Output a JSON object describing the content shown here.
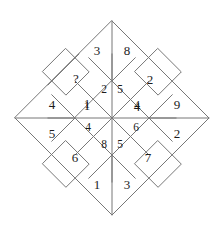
{
  "figure": {
    "type": "geometric-number-puzzle",
    "shape": "rotated-square-diamond",
    "line_color": "#777777",
    "text_color": "#1c1c1c",
    "background_color": "#ffffff",
    "unknown_marker": "?"
  },
  "geometry": {
    "center_x": 112,
    "center_y": 118,
    "outer_radius": 97,
    "middle_radius": 64,
    "inner_radius": 37,
    "top_apex_y": 15,
    "bottom_apex_y": 220,
    "left_vertex_x": 15,
    "right_vertex_x": 208
  },
  "cells": [
    {
      "id": "outer-top-left",
      "value": "3",
      "x": 97,
      "y": 50,
      "ring": "outer",
      "size": "normal"
    },
    {
      "id": "outer-top-right",
      "value": "8",
      "x": 127,
      "y": 50,
      "ring": "outer",
      "size": "normal"
    },
    {
      "id": "middle-upper-left",
      "value": "?",
      "x": 76,
      "y": 78,
      "ring": "middle",
      "size": "normal"
    },
    {
      "id": "middle-upper-right",
      "value": "2",
      "x": 150,
      "y": 79,
      "ring": "middle",
      "size": "normal"
    },
    {
      "id": "outer-left-upper",
      "value": "4",
      "x": 52,
      "y": 104,
      "ring": "outer",
      "size": "normal"
    },
    {
      "id": "outer-right-upper",
      "value": "9",
      "x": 177,
      "y": 104,
      "ring": "outer",
      "size": "normal"
    },
    {
      "id": "middle-left-upper",
      "value": "1",
      "x": 87,
      "y": 105,
      "ring": "middle",
      "size": "normal"
    },
    {
      "id": "middle-right-upper",
      "value": "4",
      "x": 137,
      "y": 106,
      "ring": "middle",
      "size": "normal"
    },
    {
      "id": "inner-top-left",
      "value": "2",
      "x": 104,
      "y": 90,
      "ring": "inner",
      "size": "small"
    },
    {
      "id": "inner-top-right",
      "value": "5",
      "x": 120,
      "y": 90,
      "ring": "inner",
      "size": "small"
    },
    {
      "id": "inner-left-upper",
      "value": "1",
      "x": 87,
      "y": 105,
      "ring": "inner",
      "size": "small"
    },
    {
      "id": "inner-right-upper",
      "value": "4",
      "x": 137,
      "y": 106,
      "ring": "inner",
      "size": "small"
    },
    {
      "id": "inner-left-lower",
      "value": "4",
      "x": 88,
      "y": 128,
      "ring": "inner",
      "size": "small"
    },
    {
      "id": "inner-right-lower",
      "value": "6",
      "x": 136,
      "y": 128,
      "ring": "inner",
      "size": "small"
    },
    {
      "id": "inner-bottom-left",
      "value": "8",
      "x": 104,
      "y": 145,
      "ring": "inner",
      "size": "small"
    },
    {
      "id": "inner-bottom-right",
      "value": "5",
      "x": 120,
      "y": 145,
      "ring": "inner",
      "size": "small"
    },
    {
      "id": "outer-left-lower",
      "value": "5",
      "x": 52,
      "y": 133,
      "ring": "outer",
      "size": "normal"
    },
    {
      "id": "outer-right-lower",
      "value": "2",
      "x": 177,
      "y": 133,
      "ring": "outer",
      "size": "normal"
    },
    {
      "id": "middle-lower-left",
      "value": "6",
      "x": 75,
      "y": 157,
      "ring": "middle",
      "size": "normal"
    },
    {
      "id": "middle-lower-right",
      "value": "7",
      "x": 148,
      "y": 157,
      "ring": "middle",
      "size": "normal"
    },
    {
      "id": "outer-bottom-left",
      "value": "1",
      "x": 97,
      "y": 184,
      "ring": "outer",
      "size": "normal"
    },
    {
      "id": "outer-bottom-right",
      "value": "3",
      "x": 127,
      "y": 184,
      "ring": "outer",
      "size": "normal"
    }
  ]
}
